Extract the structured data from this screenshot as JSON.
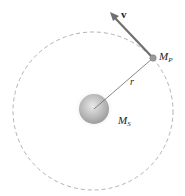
{
  "diagram": {
    "labels": {
      "velocity": "v",
      "planet_mass": "M",
      "planet_sub": "P",
      "radius": "r",
      "sun_mass": "M",
      "sun_sub": "S"
    },
    "colors": {
      "orbit": "#9a9a9a",
      "arrow": "#707070",
      "radius_line": "#6a6a6a",
      "sun": "#b8b8b8",
      "planet": "#9a9a9a"
    }
  }
}
